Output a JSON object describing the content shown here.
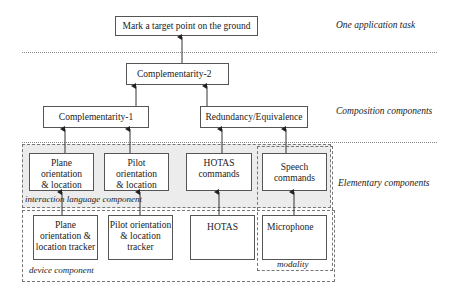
{
  "levels": {
    "task": "One application task",
    "composition": "Composition components",
    "elementary": "Elementary components"
  },
  "task_box": {
    "label": "Mark a target point on the ground"
  },
  "composition": {
    "comp2": "Complementarity-2",
    "comp1": "Complementarity-1",
    "redundancy": "Redundancy/Equivalence"
  },
  "groups": {
    "interaction": "interaction language component",
    "device": "device component",
    "modality": "modality"
  },
  "interaction_languages": [
    {
      "lines": [
        "Plane",
        "orientation",
        "& location"
      ]
    },
    {
      "lines": [
        "Pilot",
        "orientation",
        "& location"
      ]
    },
    {
      "lines": [
        "HOTAS",
        "commands"
      ]
    },
    {
      "lines": [
        "Speech",
        "commands"
      ]
    }
  ],
  "devices": [
    {
      "lines": [
        "Plane",
        "orientation &",
        "location tracker"
      ]
    },
    {
      "lines": [
        "Pilot orientation",
        "& location",
        "tracker"
      ]
    },
    {
      "lines": [
        "HOTAS"
      ]
    },
    {
      "lines": [
        "Microphone"
      ]
    }
  ],
  "colors": {
    "group_fill": "#ececec",
    "border": "#555555"
  }
}
